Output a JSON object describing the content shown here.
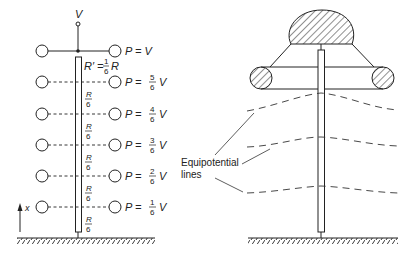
{
  "left_diagram": {
    "supply_label": "V",
    "top_resistor_label": {
      "prefix": "R′ =",
      "num": "1",
      "den": "6",
      "suffix": "R"
    },
    "segment_label": {
      "num": "R",
      "den": "6"
    },
    "rows": [
      {
        "label_prefix": "P =",
        "num": "",
        "den": "",
        "suffix": "V"
      },
      {
        "label_prefix": "P =",
        "num": "5",
        "den": "6",
        "suffix": "V"
      },
      {
        "label_prefix": "P =",
        "num": "4",
        "den": "6",
        "suffix": "V"
      },
      {
        "label_prefix": "P =",
        "num": "3",
        "den": "6",
        "suffix": "V"
      },
      {
        "label_prefix": "P =",
        "num": "2",
        "den": "6",
        "suffix": "V"
      },
      {
        "label_prefix": "P =",
        "num": "1",
        "den": "6",
        "suffix": "V"
      }
    ],
    "axis_label": "x"
  },
  "right_diagram": {
    "callout_line1": "Equipotential",
    "callout_line2": "lines"
  },
  "colors": {
    "ink": "#222222",
    "background": "#ffffff"
  }
}
